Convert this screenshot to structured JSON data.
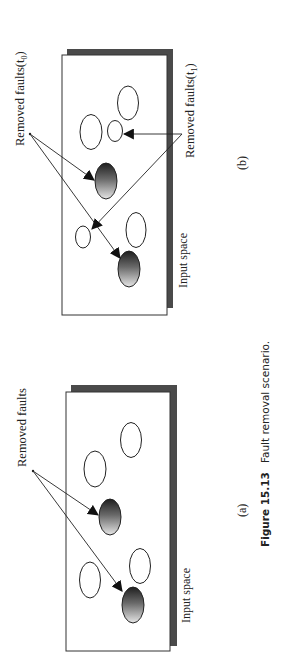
{
  "figure": {
    "number_label": "Figure 15.13",
    "caption_text": "Fault removal scenario.",
    "orientation": "rotated 90° counter-clockwise"
  },
  "colors": {
    "background": "#ffffff",
    "panel_fill": "#ffffff",
    "panel_border": "#333333",
    "panel_shadow": "#4a4a4a",
    "fault_dark": "#1e1e1e",
    "fault_light": "#e6e6e6",
    "arrow": "#222222"
  },
  "panels": [
    {
      "id": "b",
      "sub_label": "(b)",
      "region_label": "Input space",
      "labels": {
        "removed_t0": "Removed faults(t",
        "removed_t0_sub": "0",
        "removed_t0_close": ")",
        "removed_t1": "Removed faults(t",
        "removed_t1_sub": "1",
        "removed_t1_close": ")"
      },
      "faults": {
        "open": 5,
        "removed_t0": 2,
        "removed_t1": 2
      }
    },
    {
      "id": "a",
      "sub_label": "(a)",
      "region_label": "Input space",
      "labels": {
        "removed": "Removed faults"
      },
      "faults": {
        "open": 4,
        "removed": 2
      }
    }
  ]
}
